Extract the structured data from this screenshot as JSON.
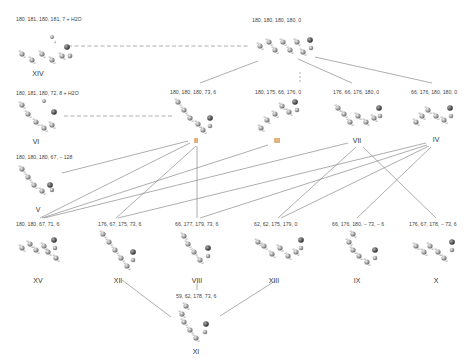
{
  "diagram": {
    "type": "conformer-network",
    "nodes": [
      {
        "id": "XIV",
        "label": "XIV",
        "dihedrals": "180, 181, 180, 181, 7 + H2O",
        "x": 45,
        "y": 35
      },
      {
        "id": "I",
        "label": "",
        "dihedrals": "180, 180, 180, 180, 0",
        "x": 300,
        "y": 35
      },
      {
        "id": "VI",
        "label": "VI",
        "dihedrals": "180, 181, 180, 72, 8 + H2O",
        "x": 40,
        "y": 105
      },
      {
        "id": "II",
        "label": "II",
        "dihedrals": "180, 180, 180, 73, 6",
        "x": 200,
        "y": 105
      },
      {
        "id": "III",
        "label": "III",
        "dihedrals": "180, 175, 66, 176, 0",
        "x": 278,
        "y": 105
      },
      {
        "id": "VII",
        "label": "VII",
        "dihedrals": "176, 66, 176, 180, 0",
        "x": 360,
        "y": 105
      },
      {
        "id": "IV",
        "label": "IV",
        "dihedrals": "66, 176, 180, 180, 0",
        "x": 435,
        "y": 105
      },
      {
        "id": "V",
        "label": "V",
        "dihedrals": "180, 180, 180, 67, − 128",
        "x": 40,
        "y": 170
      },
      {
        "id": "XV",
        "label": "XV",
        "dihedrals": "180, 180, 67, 71, 6",
        "x": 38,
        "y": 245
      },
      {
        "id": "XII",
        "label": "XII",
        "dihedrals": "176, 67, 175, 73, 6",
        "x": 118,
        "y": 245
      },
      {
        "id": "VIII",
        "label": "VIII",
        "dihedrals": "66, 177, 179, 73, 6",
        "x": 197,
        "y": 245
      },
      {
        "id": "XIII",
        "label": "XIII",
        "dihedrals": "62, 62, 175, 179, 0",
        "x": 288,
        "y": 245
      },
      {
        "id": "IX",
        "label": "IX",
        "dihedrals": "66, 176, 180, − 73, − 6",
        "x": 365,
        "y": 245
      },
      {
        "id": "X",
        "label": "X",
        "dihedrals": "176, 67, 178, − 73, 6",
        "x": 435,
        "y": 245
      },
      {
        "id": "XI",
        "label": "XI",
        "dihedrals": "59, 62, 178, 73, 6",
        "x": 195,
        "y": 315
      }
    ],
    "edges": [
      {
        "from": "XIV",
        "to": "I",
        "style": "dashed"
      },
      {
        "from": "VI",
        "to": "II",
        "style": "dashed"
      },
      {
        "from": "I",
        "to": "II",
        "style": "solid"
      },
      {
        "from": "I",
        "to": "III",
        "style": "dashed"
      },
      {
        "from": "I",
        "to": "VII",
        "style": "solid"
      },
      {
        "from": "I",
        "to": "IV",
        "style": "solid"
      },
      {
        "from": "II",
        "to": "V",
        "style": "solid"
      },
      {
        "from": "II",
        "to": "XV",
        "style": "solid"
      },
      {
        "from": "II",
        "to": "XII",
        "style": "solid"
      },
      {
        "from": "II",
        "to": "VIII",
        "style": "solid"
      },
      {
        "from": "III",
        "to": "XV",
        "style": "solid"
      },
      {
        "from": "VII",
        "to": "XV",
        "style": "solid"
      },
      {
        "from": "VII",
        "to": "XIII",
        "style": "solid"
      },
      {
        "from": "VII",
        "to": "X",
        "style": "solid"
      },
      {
        "from": "IV",
        "to": "XII",
        "style": "solid"
      },
      {
        "from": "IV",
        "to": "VIII",
        "style": "solid"
      },
      {
        "from": "IV",
        "to": "XIII",
        "style": "solid"
      },
      {
        "from": "IV",
        "to": "IX",
        "style": "solid"
      },
      {
        "from": "XII",
        "to": "XI",
        "style": "solid"
      },
      {
        "from": "VIII",
        "to": "XI",
        "style": "solid"
      },
      {
        "from": "XIII",
        "to": "XI",
        "style": "solid"
      }
    ]
  }
}
